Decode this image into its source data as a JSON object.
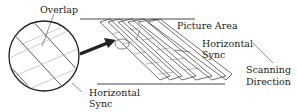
{
  "diagram": {
    "type": "helical-scan-track-layout",
    "labels": {
      "overlap": "Overlap",
      "picture_area": "Picture Area",
      "horizontal_sync_right_line1": "Horizontal",
      "horizontal_sync_right_line2": "Sync",
      "scanning_direction_line1": "Scanning",
      "scanning_direction_line2": "Direction",
      "horizontal_sync_bottom_line1": "Horizontal",
      "horizontal_sync_bottom_line2": "Sync"
    },
    "colors": {
      "line": "#333333",
      "thin_line": "#777777",
      "arrow": "#222222",
      "background": "#ffffff"
    }
  }
}
